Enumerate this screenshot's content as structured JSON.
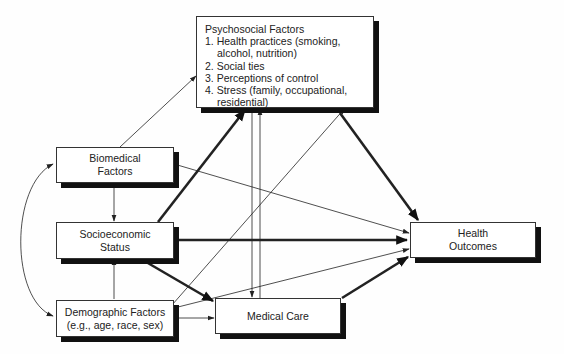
{
  "nodes": {
    "psychosocial": {
      "title": "Psychosocial Factors",
      "items": [
        "1. Health practices (smoking, alcohol, nutrition)",
        "2. Social ties",
        "3. Perceptions of control",
        "4. Stress (family, occupational, residential)"
      ]
    },
    "biomedical": {
      "line1": "Biomedical",
      "line2": "Factors"
    },
    "socioeconomic": {
      "line1": "Socioeconomic",
      "line2": "Status"
    },
    "demographic": {
      "line1": "Demographic Factors",
      "line2": "(e.g., age, race, sex)"
    },
    "medical_care": {
      "label": "Medical Care"
    },
    "health_outcomes": {
      "line1": "Health",
      "line2": "Outcomes"
    }
  },
  "edges": [
    {
      "from": "biomedical",
      "to": "psychosocial",
      "weight": "thin"
    },
    {
      "from": "biomedical",
      "to": "socioeconomic",
      "weight": "thin"
    },
    {
      "from": "biomedical",
      "to": "health_outcomes",
      "weight": "thin"
    },
    {
      "from": "biomedical",
      "to": "demographic",
      "weight": "thin",
      "style": "curved-bidirectional"
    },
    {
      "from": "socioeconomic",
      "to": "psychosocial",
      "weight": "thick"
    },
    {
      "from": "socioeconomic",
      "to": "health_outcomes",
      "weight": "thick"
    },
    {
      "from": "socioeconomic",
      "to": "medical_care",
      "weight": "thick"
    },
    {
      "from": "demographic",
      "to": "socioeconomic",
      "weight": "thin"
    },
    {
      "from": "demographic",
      "to": "psychosocial",
      "weight": "thin"
    },
    {
      "from": "demographic",
      "to": "medical_care",
      "weight": "thin"
    },
    {
      "from": "demographic",
      "to": "health_outcomes",
      "weight": "thin"
    },
    {
      "from": "psychosocial",
      "to": "medical_care",
      "weight": "thin"
    },
    {
      "from": "medical_care",
      "to": "psychosocial",
      "weight": "thin"
    },
    {
      "from": "psychosocial",
      "to": "health_outcomes",
      "weight": "thick"
    },
    {
      "from": "medical_care",
      "to": "health_outcomes",
      "weight": "thick"
    }
  ]
}
